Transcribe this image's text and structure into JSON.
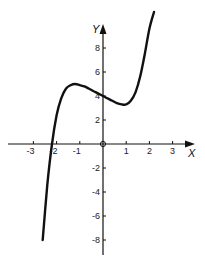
{
  "chart_data": {
    "type": "line",
    "title": "",
    "xlabel": "X",
    "ylabel": "Y",
    "xlim": [
      -3.5,
      3.5
    ],
    "ylim": [
      -9,
      11
    ],
    "grid": false,
    "legend": null,
    "x_ticks": [
      -3,
      -2,
      -1,
      1,
      2,
      3
    ],
    "x_tick_labels": [
      "-3",
      "-2",
      "-1",
      "1",
      "2",
      "3"
    ],
    "y_ticks": [
      8,
      6,
      4,
      2,
      -2,
      -4,
      -6,
      -8
    ],
    "y_tick_labels": [
      "8",
      "6",
      "4",
      "2",
      "-2",
      "-4",
      "-6",
      "-8"
    ],
    "origin_marker": "circle",
    "series": [
      {
        "name": "cubic curve",
        "x": [
          -2.6,
          -2.4,
          -2.2,
          -2.0,
          -1.8,
          -1.6,
          -1.4,
          -1.2,
          -1.0,
          -0.8,
          -0.6,
          -0.4,
          -0.2,
          0.0,
          0.2,
          0.4,
          0.6,
          0.8,
          1.0,
          1.2,
          1.4,
          1.6,
          1.8,
          2.0,
          2.2
        ],
        "y": [
          -8.0,
          -3.4,
          0.0,
          2.4,
          3.8,
          4.6,
          4.9,
          5.0,
          4.9,
          4.8,
          4.6,
          4.4,
          4.2,
          4.0,
          3.8,
          3.6,
          3.4,
          3.3,
          3.3,
          3.6,
          4.3,
          5.6,
          7.5,
          9.6,
          11.0
        ]
      }
    ]
  },
  "axes": {
    "x_label": "X",
    "y_label": "Y"
  }
}
